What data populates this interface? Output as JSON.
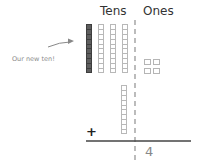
{
  "headers": {
    "tens": "Tens",
    "ones": "Ones"
  },
  "annotation": {
    "label": "Our new ten!",
    "icon": "arrow-right-icon"
  },
  "tens_rods": [
    {
      "style": "dark",
      "units": 10
    },
    {
      "style": "light",
      "units": 10
    },
    {
      "style": "light",
      "units": 10
    },
    {
      "style": "light",
      "units": 10
    }
  ],
  "ones_cubes": 4,
  "addend_rod": {
    "style": "light",
    "units": 10
  },
  "operator": "+",
  "result": {
    "tens": "",
    "ones": "4"
  },
  "colors": {
    "dark_rod": "#5e5e5e",
    "light_rod_border": "#b8b8b8",
    "label": "#8a8a8a",
    "divider": "#888888"
  }
}
